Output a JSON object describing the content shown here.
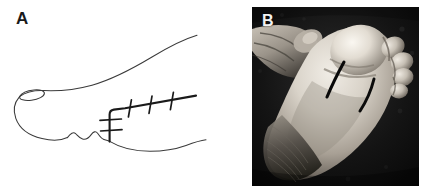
{
  "figure": {
    "width": 426,
    "height": 192,
    "background_color": "#ffffff",
    "panel_count": 2
  },
  "panel_a": {
    "label": "A",
    "label_color": "#1a1a1a",
    "type": "line-drawing-schematic",
    "subject": "foot lateral plantar view with surgical incision markings",
    "line_color": "#3a3a3a",
    "incision_color": "#1a1a1a",
    "background_color": "#ffffff",
    "features": {
      "hallux_nail_outline": "present",
      "toe_scallops": 3,
      "dorsal_contour": "present",
      "plantar_contour": "present",
      "long_incision_ticks": 3,
      "short_incision_ticks": 2
    }
  },
  "panel_b": {
    "label": "B",
    "label_color": "#f2f2f2",
    "type": "clinical-photograph",
    "subject": "plantar surface of foot held by hand with two dark incision marks",
    "color_mode": "grayscale",
    "border_color": "#0a0a0a",
    "features": {
      "incision_marks": 2,
      "hand_visible": true,
      "toes_visible": true,
      "heel_visible": true
    }
  }
}
